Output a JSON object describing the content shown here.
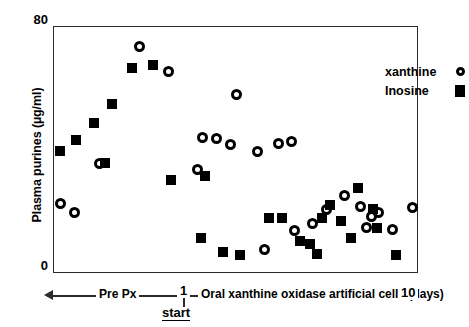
{
  "figure": {
    "background_color": "#ffffff",
    "marker_color": "#000000",
    "axis_color": "#2b2b2b"
  },
  "axes": {
    "y_title": "Plasma purines (µg/ml)",
    "y_ticks": [
      "80",
      "0"
    ],
    "y_min": 0,
    "y_max": 80,
    "x_min_label": "Pre Px",
    "x_start_label": "1",
    "x_start_caption": "start",
    "x_title": "Oral xanthine oxidase artificial cells (days)",
    "x_max_label": "10"
  },
  "legend": {
    "position": "top-right",
    "entries": [
      {
        "label": "xanthine",
        "marker": "open-circle"
      },
      {
        "label": "Inosine",
        "marker": "filled-square"
      }
    ]
  },
  "chart_data": {
    "type": "scatter",
    "title": "",
    "xlabel": "Oral xanthine oxidase artificial cells (days)",
    "ylabel": "Plasma purines (µg/ml)",
    "ylim": [
      0,
      80
    ],
    "xlim": [
      -3.2,
      10
    ],
    "grid": false,
    "legend_position": "top-right",
    "x_axis_notes": {
      "pre_treatment_region_label": "Pre Px",
      "treatment_start_day": 1,
      "treatment_start_caption": "start",
      "axis_end_label": "10"
    },
    "series": [
      {
        "name": "xanthine",
        "marker": "open-circle",
        "points": [
          {
            "x": -2.95,
            "y": 22.5
          },
          {
            "x": -2.45,
            "y": 19.5
          },
          {
            "x": -1.55,
            "y": 35.5
          },
          {
            "x": -0.1,
            "y": 73.5
          },
          {
            "x": 0.95,
            "y": 65.5
          },
          {
            "x": 2.2,
            "y": 44.0
          },
          {
            "x": 2.7,
            "y": 43.5
          },
          {
            "x": 3.45,
            "y": 58.0
          },
          {
            "x": 3.2,
            "y": 41.5
          },
          {
            "x": 2.0,
            "y": 33.5
          },
          {
            "x": 4.2,
            "y": 39.5
          },
          {
            "x": 4.95,
            "y": 42.0
          },
          {
            "x": 5.45,
            "y": 42.5
          },
          {
            "x": 4.45,
            "y": 7.5
          },
          {
            "x": 5.55,
            "y": 13.5
          },
          {
            "x": 6.2,
            "y": 16.0
          },
          {
            "x": 6.7,
            "y": 20.5
          },
          {
            "x": 7.35,
            "y": 25.0
          },
          {
            "x": 7.95,
            "y": 21.5
          },
          {
            "x": 8.35,
            "y": 18.0
          },
          {
            "x": 8.6,
            "y": 19.5
          },
          {
            "x": 8.15,
            "y": 14.5
          },
          {
            "x": 9.1,
            "y": 14.0
          },
          {
            "x": 9.85,
            "y": 21.0
          }
        ]
      },
      {
        "name": "Inosine",
        "marker": "filled-square",
        "points": [
          {
            "x": -3.0,
            "y": 39.5
          },
          {
            "x": -2.4,
            "y": 43.0
          },
          {
            "x": -1.75,
            "y": 48.5
          },
          {
            "x": -1.1,
            "y": 55.0
          },
          {
            "x": -0.35,
            "y": 66.5
          },
          {
            "x": 0.4,
            "y": 67.5
          },
          {
            "x": -1.35,
            "y": 35.5
          },
          {
            "x": 1.05,
            "y": 30.0
          },
          {
            "x": 2.3,
            "y": 31.5
          },
          {
            "x": 2.15,
            "y": 11.0
          },
          {
            "x": 2.95,
            "y": 6.5
          },
          {
            "x": 3.55,
            "y": 5.5
          },
          {
            "x": 4.6,
            "y": 17.5
          },
          {
            "x": 5.1,
            "y": 17.5
          },
          {
            "x": 5.75,
            "y": 10.0
          },
          {
            "x": 6.1,
            "y": 9.0
          },
          {
            "x": 6.35,
            "y": 6.0
          },
          {
            "x": 6.85,
            "y": 22.0
          },
          {
            "x": 6.55,
            "y": 17.5
          },
          {
            "x": 7.25,
            "y": 16.5
          },
          {
            "x": 7.6,
            "y": 11.0
          },
          {
            "x": 7.85,
            "y": 27.5
          },
          {
            "x": 8.4,
            "y": 20.5
          },
          {
            "x": 8.55,
            "y": 14.5
          },
          {
            "x": 9.25,
            "y": 5.5
          }
        ]
      }
    ]
  }
}
